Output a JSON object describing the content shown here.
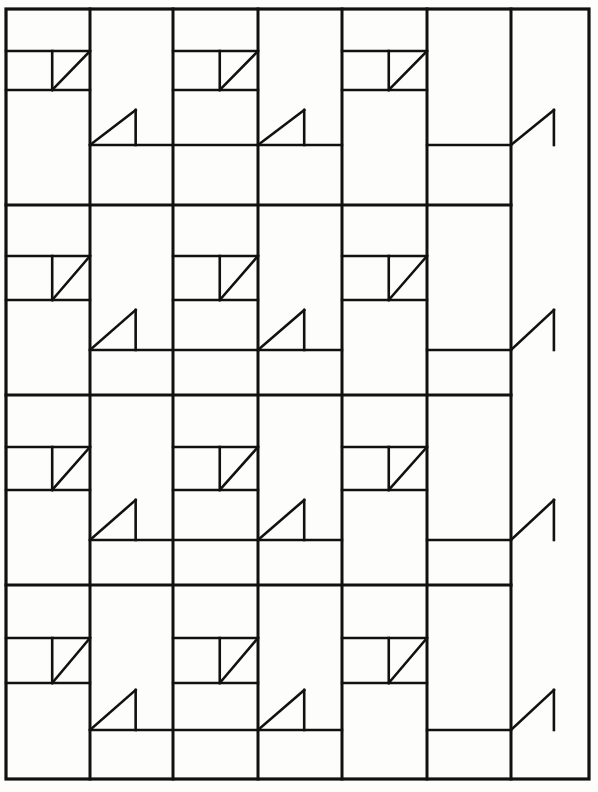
{
  "figure": {
    "background_color": "#fdfdfc",
    "ink_color": "#111111"
  },
  "canvas": {
    "width": 598,
    "height": 792
  },
  "border": {
    "x": 6,
    "y": 9,
    "width": 583,
    "height": 770,
    "stroke_width": 3.2,
    "color": "#111111"
  },
  "grid": {
    "column_count": 6,
    "row_band_count": 8,
    "column_x": [
      6,
      90,
      173,
      258,
      342,
      427,
      511,
      589
    ],
    "column_labels": [
      "col-1",
      "col-2",
      "col-3",
      "col-4",
      "col-5",
      "col-6"
    ],
    "major_row_y": [
      9,
      90,
      205,
      300,
      395,
      490,
      585,
      683,
      779
    ],
    "minor_row_y": [
      51,
      145,
      256,
      350,
      447,
      540,
      638,
      730
    ],
    "line_width_major": 3.0,
    "line_width_minor": 2.4,
    "color": "#111111"
  },
  "motifs": {
    "type_a": {
      "name": "triangle-down-left",
      "label": "Motif A",
      "description": "Upper horizontal rail, short vertical stub descending at 55% width, hypotenuse falling from upper-right to lower-left.",
      "stub_fraction": 0.55,
      "stroke_width": 2.6
    },
    "type_b": {
      "name": "triangle-up-right",
      "label": "Motif B",
      "description": "Lower horizontal rail, short vertical riser at 55% width, hypotenuse climbing from lower-left to upper-right.",
      "stub_fraction": 0.55,
      "stroke_width": 2.6
    },
    "cells": [
      {
        "col": 0,
        "band": 0,
        "type": "a",
        "x": 6,
        "y": 51,
        "w": 84,
        "h": 39
      },
      {
        "col": 2,
        "band": 0,
        "type": "a",
        "x": 173,
        "y": 51,
        "w": 85,
        "h": 39
      },
      {
        "col": 4,
        "band": 0,
        "type": "a",
        "x": 342,
        "y": 51,
        "w": 85,
        "h": 39
      },
      {
        "col": 1,
        "band": 1,
        "type": "b",
        "x": 90,
        "y": 110,
        "w": 83,
        "h": 35
      },
      {
        "col": 3,
        "band": 1,
        "type": "b",
        "x": 258,
        "y": 110,
        "w": 84,
        "h": 35
      },
      {
        "col": 5,
        "band": 1,
        "type": "b",
        "x": 511,
        "y": 110,
        "w": 78,
        "h": 35
      },
      {
        "col": 0,
        "band": 2,
        "type": "a",
        "x": 6,
        "y": 256,
        "w": 84,
        "h": 44
      },
      {
        "col": 2,
        "band": 2,
        "type": "a",
        "x": 173,
        "y": 256,
        "w": 85,
        "h": 44
      },
      {
        "col": 4,
        "band": 2,
        "type": "a",
        "x": 342,
        "y": 256,
        "w": 85,
        "h": 44
      },
      {
        "col": 1,
        "band": 3,
        "type": "b",
        "x": 90,
        "y": 310,
        "w": 83,
        "h": 40
      },
      {
        "col": 3,
        "band": 3,
        "type": "b",
        "x": 258,
        "y": 310,
        "w": 84,
        "h": 40
      },
      {
        "col": 5,
        "band": 3,
        "type": "b",
        "x": 511,
        "y": 310,
        "w": 78,
        "h": 40
      },
      {
        "col": 0,
        "band": 4,
        "type": "a",
        "x": 6,
        "y": 447,
        "w": 84,
        "h": 43
      },
      {
        "col": 2,
        "band": 4,
        "type": "a",
        "x": 173,
        "y": 447,
        "w": 85,
        "h": 43
      },
      {
        "col": 4,
        "band": 4,
        "type": "a",
        "x": 342,
        "y": 447,
        "w": 85,
        "h": 43
      },
      {
        "col": 1,
        "band": 5,
        "type": "b",
        "x": 90,
        "y": 500,
        "w": 83,
        "h": 40
      },
      {
        "col": 3,
        "band": 5,
        "type": "b",
        "x": 258,
        "y": 500,
        "w": 84,
        "h": 40
      },
      {
        "col": 5,
        "band": 5,
        "type": "b",
        "x": 511,
        "y": 500,
        "w": 78,
        "h": 40
      },
      {
        "col": 0,
        "band": 6,
        "type": "a",
        "x": 6,
        "y": 638,
        "w": 84,
        "h": 45
      },
      {
        "col": 2,
        "band": 6,
        "type": "a",
        "x": 173,
        "y": 638,
        "w": 85,
        "h": 45
      },
      {
        "col": 4,
        "band": 6,
        "type": "a",
        "x": 342,
        "y": 638,
        "w": 85,
        "h": 45
      },
      {
        "col": 1,
        "band": 7,
        "type": "b",
        "x": 90,
        "y": 690,
        "w": 83,
        "h": 40
      },
      {
        "col": 3,
        "band": 7,
        "type": "b",
        "x": 258,
        "y": 690,
        "w": 84,
        "h": 40
      },
      {
        "col": 5,
        "band": 7,
        "type": "b",
        "x": 511,
        "y": 690,
        "w": 78,
        "h": 40
      }
    ]
  },
  "segments": {
    "description": "Horizontal rails that do not span the full width; each entry gives start and end column indices.",
    "minor_rails": [
      {
        "y": 51,
        "spans": [
          [
            0,
            1
          ],
          [
            2,
            3
          ],
          [
            4,
            5
          ]
        ]
      },
      {
        "y": 90,
        "spans": [
          [
            0,
            1
          ],
          [
            2,
            3
          ],
          [
            4,
            5
          ]
        ]
      },
      {
        "y": 145,
        "spans": [
          [
            1,
            3
          ],
          [
            3,
            4
          ],
          [
            5,
            6
          ]
        ]
      },
      {
        "y": 205,
        "spans": [
          [
            0,
            6
          ]
        ]
      },
      {
        "y": 256,
        "spans": [
          [
            0,
            1
          ],
          [
            2,
            3
          ],
          [
            4,
            5
          ]
        ]
      },
      {
        "y": 300,
        "spans": [
          [
            0,
            1
          ],
          [
            2,
            3
          ],
          [
            4,
            5
          ]
        ]
      },
      {
        "y": 350,
        "spans": [
          [
            1,
            3
          ],
          [
            3,
            4
          ],
          [
            5,
            6
          ]
        ]
      },
      {
        "y": 395,
        "spans": [
          [
            0,
            6
          ]
        ]
      },
      {
        "y": 447,
        "spans": [
          [
            0,
            1
          ],
          [
            2,
            3
          ],
          [
            4,
            5
          ]
        ]
      },
      {
        "y": 490,
        "spans": [
          [
            0,
            1
          ],
          [
            2,
            3
          ],
          [
            4,
            5
          ]
        ]
      },
      {
        "y": 540,
        "spans": [
          [
            1,
            3
          ],
          [
            3,
            4
          ],
          [
            5,
            6
          ]
        ]
      },
      {
        "y": 585,
        "spans": [
          [
            0,
            6
          ]
        ]
      },
      {
        "y": 638,
        "spans": [
          [
            0,
            1
          ],
          [
            2,
            3
          ],
          [
            4,
            5
          ]
        ]
      },
      {
        "y": 683,
        "spans": [
          [
            0,
            1
          ],
          [
            2,
            3
          ],
          [
            4,
            5
          ]
        ]
      },
      {
        "y": 730,
        "spans": [
          [
            1,
            3
          ],
          [
            3,
            4
          ],
          [
            5,
            6
          ]
        ]
      }
    ]
  }
}
